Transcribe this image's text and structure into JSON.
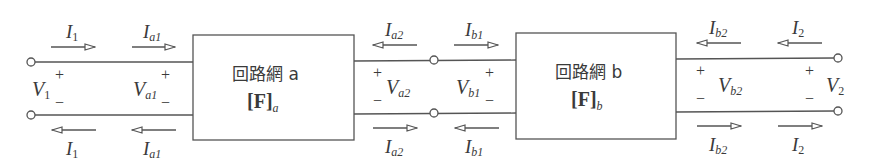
{
  "diagram": {
    "type": "two-port cascade connection",
    "colors": {
      "stroke": "#555555",
      "text": "#3a3a3a",
      "background": "#ffffff"
    },
    "networks": [
      {
        "id": "a",
        "name": "回路網 a",
        "matrix_base": "[F]",
        "matrix_sub": "a"
      },
      {
        "id": "b",
        "name": "回路網 b",
        "matrix_base": "[F]",
        "matrix_sub": "b"
      }
    ],
    "voltages": [
      {
        "id": "V1",
        "base": "V",
        "sub": "1"
      },
      {
        "id": "Va1",
        "base": "V",
        "sub": "a1"
      },
      {
        "id": "Va2",
        "base": "V",
        "sub": "a2"
      },
      {
        "id": "Vb1",
        "base": "V",
        "sub": "b1"
      },
      {
        "id": "Vb2",
        "base": "V",
        "sub": "b2"
      },
      {
        "id": "V2",
        "base": "V",
        "sub": "2"
      }
    ],
    "currents_top": [
      {
        "id": "I1",
        "base": "I",
        "sub": "1",
        "direction": "right"
      },
      {
        "id": "Ia1",
        "base": "I",
        "sub": "a1",
        "direction": "right"
      },
      {
        "id": "Ia2",
        "base": "I",
        "sub": "a2",
        "direction": "left"
      },
      {
        "id": "Ib1",
        "base": "I",
        "sub": "b1",
        "direction": "right"
      },
      {
        "id": "Ib2",
        "base": "I",
        "sub": "b2",
        "direction": "left"
      },
      {
        "id": "I2",
        "base": "I",
        "sub": "2",
        "direction": "left"
      }
    ],
    "currents_bottom": [
      {
        "id": "I1",
        "base": "I",
        "sub": "1",
        "direction": "left"
      },
      {
        "id": "Ia1",
        "base": "I",
        "sub": "a1",
        "direction": "left"
      },
      {
        "id": "Ia2",
        "base": "I",
        "sub": "a2",
        "direction": "right"
      },
      {
        "id": "Ib1",
        "base": "I",
        "sub": "b1",
        "direction": "left"
      },
      {
        "id": "Ib2",
        "base": "I",
        "sub": "b2",
        "direction": "right"
      },
      {
        "id": "I2",
        "base": "I",
        "sub": "2",
        "direction": "right"
      }
    ],
    "polarity": {
      "plus": "+",
      "minus": "−"
    }
  }
}
